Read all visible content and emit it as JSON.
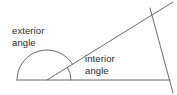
{
  "diagram": {
    "type": "geometry-angle-diagram",
    "background_color": "#ffffff",
    "stroke_color": "#5a5a5a",
    "text_color": "#2b2b2b",
    "labels": {
      "exterior": {
        "line1": "exterior",
        "line2": "angle",
        "full": "exterior angle"
      },
      "interior": {
        "line1": "interior",
        "line2": "angle",
        "full": "interior angle"
      }
    },
    "geometry": {
      "base_line": {
        "x1": 17,
        "y1": 80,
        "x2": 170,
        "y2": 80
      },
      "transversal_line": {
        "x1": 47,
        "y1": 80,
        "x2": 173,
        "y2": 2
      },
      "right_side_line": {
        "x1": 150,
        "y1": 8,
        "x2": 173,
        "y2": 93
      },
      "vertex": {
        "x": 47,
        "y": 80
      },
      "exterior_arc_radius": 30,
      "interior_arc_radius": 24
    }
  }
}
